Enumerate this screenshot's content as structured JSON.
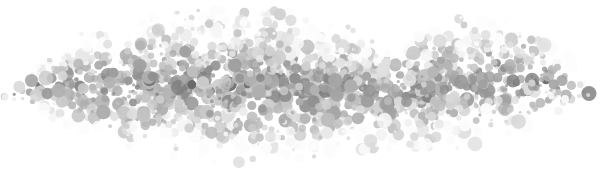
{
  "figure": {
    "type": "scatter-dot-cloud",
    "width": 605,
    "height": 177,
    "background_color": "#ffffff",
    "title": "",
    "subtitle": "",
    "axis_labels": {
      "x": "",
      "y": ""
    },
    "legend": [],
    "annotations": []
  },
  "chart_data": {
    "type": "scatter",
    "title": "",
    "xlabel": "",
    "ylabel": "",
    "xlim": [
      0,
      605
    ],
    "ylim": [
      0,
      177
    ],
    "grid": false,
    "legend_position": "none",
    "background_color": "#ffffff",
    "marker": {
      "shape": "circle",
      "diameter_min": 3,
      "diameter_max": 15,
      "edge": "none"
    },
    "color_scale": {
      "type": "grayscale",
      "lightest": "#f4f4f4",
      "light": "#e4e4e4",
      "mid": "#c8c8c8",
      "dark": "#9a9a9a",
      "darkest": "#4a4a4a"
    },
    "point_count": 1850,
    "density_profile": {
      "description": "horizontal lens-shaped blob spanning full width, densest and darkest in central band",
      "core_y_range": [
        58,
        125
      ],
      "core_x_range": [
        60,
        540
      ],
      "falloff": "gaussian"
    },
    "cloud_outline_top": [
      {
        "x": 0,
        "y": 96
      },
      {
        "x": 40,
        "y": 60
      },
      {
        "x": 90,
        "y": 36
      },
      {
        "x": 150,
        "y": 22
      },
      {
        "x": 215,
        "y": 12
      },
      {
        "x": 275,
        "y": 14
      },
      {
        "x": 330,
        "y": 30
      },
      {
        "x": 375,
        "y": 40
      },
      {
        "x": 420,
        "y": 34
      },
      {
        "x": 470,
        "y": 20
      },
      {
        "x": 520,
        "y": 28
      },
      {
        "x": 560,
        "y": 52
      },
      {
        "x": 590,
        "y": 86
      },
      {
        "x": 605,
        "y": 100
      }
    ],
    "cloud_outline_bottom": [
      {
        "x": 0,
        "y": 100
      },
      {
        "x": 40,
        "y": 112
      },
      {
        "x": 90,
        "y": 132
      },
      {
        "x": 150,
        "y": 146
      },
      {
        "x": 215,
        "y": 156
      },
      {
        "x": 275,
        "y": 158
      },
      {
        "x": 330,
        "y": 150
      },
      {
        "x": 375,
        "y": 142
      },
      {
        "x": 420,
        "y": 146
      },
      {
        "x": 470,
        "y": 140
      },
      {
        "x": 520,
        "y": 126
      },
      {
        "x": 560,
        "y": 110
      },
      {
        "x": 590,
        "y": 100
      },
      {
        "x": 605,
        "y": 98
      }
    ],
    "outlier_points": [
      {
        "x": 5,
        "y": 97,
        "d": 7,
        "shade": "#eeeeee"
      },
      {
        "x": 14,
        "y": 99,
        "d": 4,
        "shade": "#f0f0f0"
      }
    ],
    "seed": 20240517
  }
}
